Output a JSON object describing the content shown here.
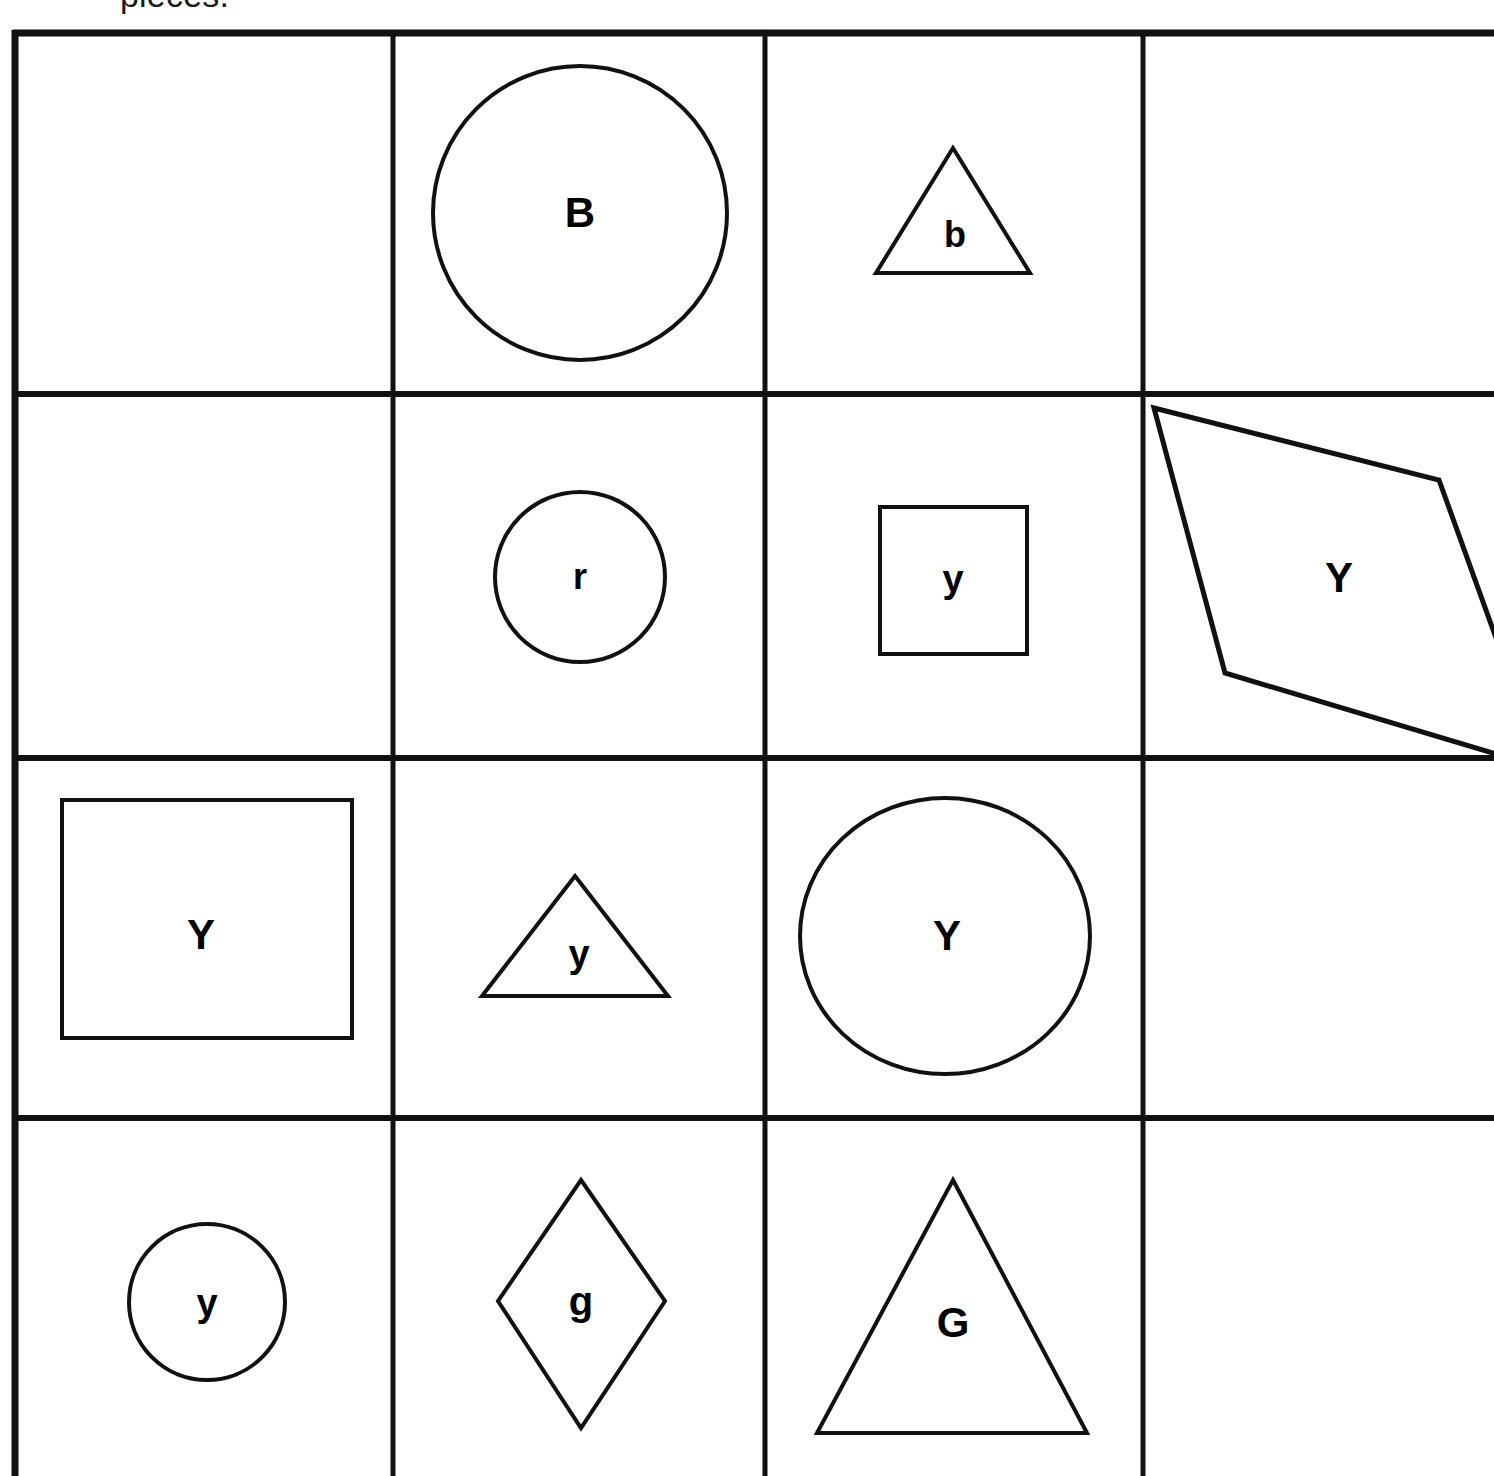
{
  "document": {
    "clipped_heading": "pieces.",
    "line_color": "#111111",
    "shape_stroke_color": "#111111",
    "background": "#ffffff"
  },
  "grid": {
    "columns": 4,
    "rows": 4,
    "column_edges_px": [
      13,
      393,
      765,
      1143,
      1494
    ],
    "row_edges_px": [
      30,
      394,
      758,
      1118,
      1476
    ],
    "outer_border_width_px": 6,
    "inner_line_width_px": 4
  },
  "cells": [
    {
      "id": "r1c1",
      "row": 1,
      "col": 1,
      "shape": "none",
      "label": ""
    },
    {
      "id": "r1c2",
      "row": 1,
      "col": 2,
      "shape": "circle-large",
      "label": "B"
    },
    {
      "id": "r1c3",
      "row": 1,
      "col": 3,
      "shape": "triangle-small",
      "label": "b"
    },
    {
      "id": "r1c4",
      "row": 1,
      "col": 4,
      "shape": "none",
      "label": ""
    },
    {
      "id": "r2c1",
      "row": 2,
      "col": 1,
      "shape": "none",
      "label": ""
    },
    {
      "id": "r2c2",
      "row": 2,
      "col": 2,
      "shape": "circle-small",
      "label": "r"
    },
    {
      "id": "r2c3",
      "row": 2,
      "col": 3,
      "shape": "square-small",
      "label": "y"
    },
    {
      "id": "r2c4",
      "row": 2,
      "col": 4,
      "shape": "parallelogram-large",
      "label": "Y"
    },
    {
      "id": "r3c1",
      "row": 3,
      "col": 1,
      "shape": "square-large",
      "label": "Y"
    },
    {
      "id": "r3c2",
      "row": 3,
      "col": 2,
      "shape": "triangle-small",
      "label": "y"
    },
    {
      "id": "r3c3",
      "row": 3,
      "col": 3,
      "shape": "circle-large",
      "label": "Y"
    },
    {
      "id": "r3c4",
      "row": 3,
      "col": 4,
      "shape": "none",
      "label": ""
    },
    {
      "id": "r4c1",
      "row": 4,
      "col": 1,
      "shape": "circle-small",
      "label": "y"
    },
    {
      "id": "r4c2",
      "row": 4,
      "col": 2,
      "shape": "rhombus-tall",
      "label": "g"
    },
    {
      "id": "r4c3",
      "row": 4,
      "col": 3,
      "shape": "triangle-large",
      "label": "G"
    },
    {
      "id": "r4c4",
      "row": 4,
      "col": 4,
      "shape": "none",
      "label": ""
    }
  ],
  "labels": {
    "r1c2": "B",
    "r1c3": "b",
    "r2c2": "r",
    "r2c3": "y",
    "r2c4": "Y",
    "r3c1": "Y",
    "r3c2": "y",
    "r3c3": "Y",
    "r4c1": "y",
    "r4c2": "g",
    "r4c3": "G"
  }
}
